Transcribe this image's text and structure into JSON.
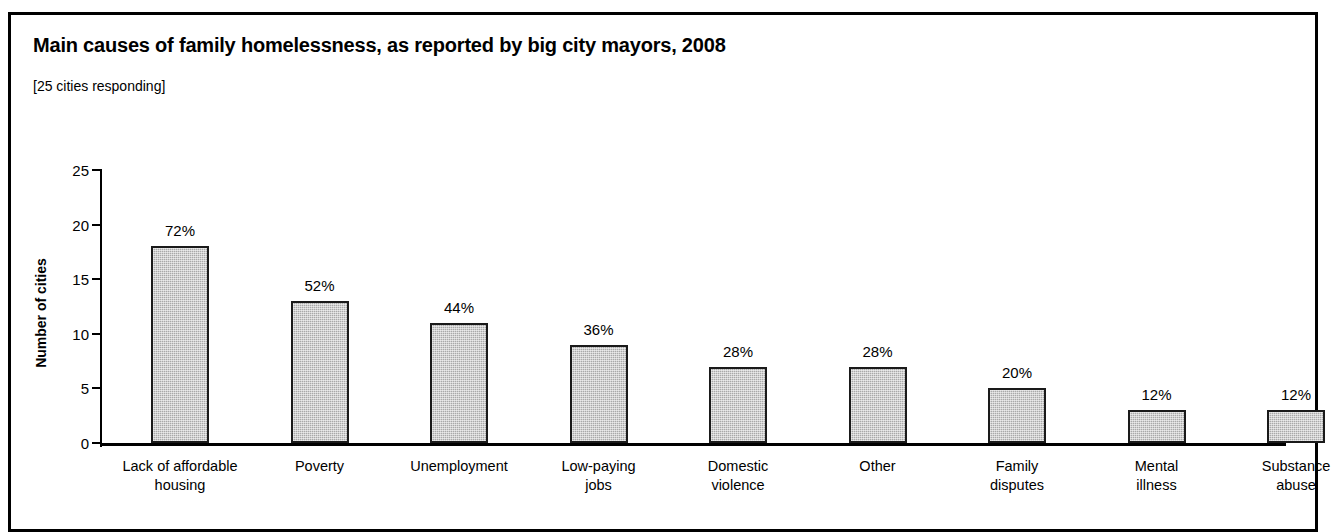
{
  "figure": {
    "title": "Main causes of family homelessness, as reported by big city mayors, 2008",
    "subtitle": "[25 cities responding]"
  },
  "chart_data": {
    "type": "bar",
    "title": "Main causes of family homelessness, as reported by big city mayors, 2008",
    "subtitle": "[25 cities responding]",
    "xlabel": "",
    "ylabel": "Number of cities",
    "ylim": [
      0,
      25
    ],
    "yticks": [
      0,
      5,
      10,
      15,
      20,
      25
    ],
    "ytick_labels": [
      "0",
      "5",
      "10",
      "15",
      "20",
      "25"
    ],
    "grid": false,
    "legend": false,
    "total_cities": 25,
    "categories": [
      "Lack of affordable\nhousing",
      "Poverty",
      "Unemployment",
      "Low-paying\njobs",
      "Domestic\nviolence",
      "Other",
      "Family\ndisputes",
      "Mental\nillness",
      "Substance\nabuse"
    ],
    "values": [
      18,
      13,
      11,
      9,
      7,
      7,
      5,
      3,
      3
    ],
    "data_labels": [
      "72%",
      "52%",
      "44%",
      "36%",
      "28%",
      "28%",
      "20%",
      "12%",
      "12%"
    ],
    "percentages": [
      72,
      52,
      44,
      36,
      28,
      28,
      20,
      12,
      12
    ],
    "bar_fill_color": "#a9a9a9",
    "bar_edge_color": "#1a1a1a"
  }
}
